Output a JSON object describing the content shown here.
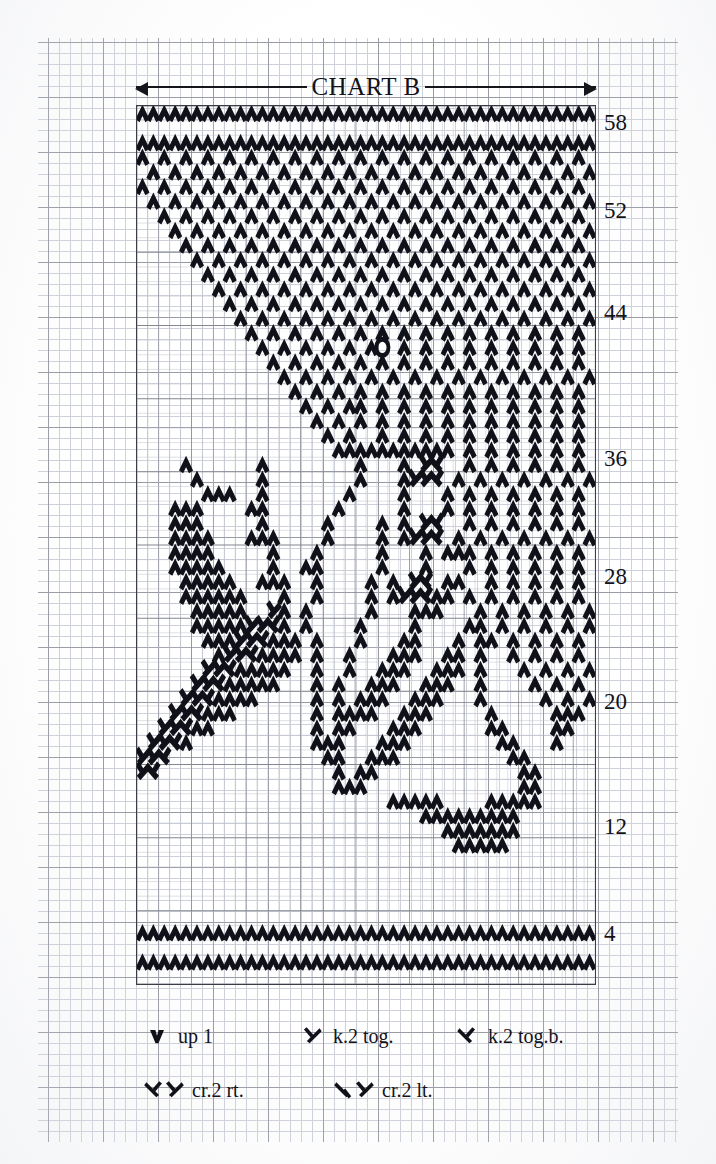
{
  "document": {
    "type": "knitting-stitch-chart",
    "title": "CHART B"
  },
  "chart": {
    "title": "CHART B",
    "columns": 42,
    "rows": 60,
    "row_numbers": [
      "58",
      "52",
      "44",
      "36",
      "28",
      "20",
      "12",
      "4"
    ],
    "row_number_values": [
      58,
      52,
      44,
      36,
      28,
      20,
      12,
      4
    ],
    "grid_color": "#c9ccd6",
    "major_grid_color": "#8d8f9a",
    "symbol_color": "#101119",
    "border_color": "#3b3d46"
  },
  "legend": {
    "rows": [
      [
        {
          "symbol": "up1",
          "label": "up 1"
        },
        {
          "symbol": "k2tog",
          "label": "k.2 tog."
        },
        {
          "symbol": "k2togb",
          "label": "k.2 tog.b."
        }
      ],
      [
        {
          "symbol": "cr2rt",
          "label": "cr.2 rt."
        },
        {
          "symbol": "cr2lt",
          "label": "cr.2 lt."
        }
      ]
    ]
  },
  "chart_data": {
    "type": "heatmap",
    "title": "CHART B",
    "xlabel": "",
    "ylabel": "",
    "legend_position": "bottom",
    "grid": true,
    "symbol_key": {
      "v": "up 1",
      "k": "k.2 tog.",
      "b": "k.2 tog.b.",
      "r": "cr.2 rt.",
      "l": "cr.2 lt.",
      "o": "special knot",
      ".": "empty"
    },
    "columns": 42,
    "rows": 60,
    "row_labels_right": [
      58,
      52,
      44,
      36,
      28,
      20,
      12,
      4
    ],
    "cells": [
      {
        "row": 60,
        "pattern": "vvvvvvvvvvvvvvvvvvvvvvvvvvvvvvvvvvvvvvvvvv"
      },
      {
        "row": 59,
        "pattern": ".........................................."
      },
      {
        "row": 58,
        "pattern": "vvvvvvvvvvvvvvvvvvvvvvvvvvvvvvvvvvvvvvvvvv"
      },
      {
        "row": 57,
        "pattern": "v.v.v.v.v.v.v.v.v.v.v.v.v.v.v.v.v.v.v.v.v."
      },
      {
        "row": 56,
        "pattern": ".v.v.v.v.v.v.v.v.v.v.v.v.v.v.v.v.v.v.v.v.v"
      },
      {
        "row": 55,
        "pattern": "v.v.v.v.v.v.v.v.v.v.v.v.v.v.v.v.v.v.v.v.v."
      },
      {
        "row": 54,
        "pattern": ".v.v.v.v.v.v.v.v.v.v.v.v.v.v.v.v.v.v.v.v.v"
      },
      {
        "row": 53,
        "pattern": "..v.v.v.v.v.v.v.v.v.v.v.v.v.v.v.v.v.v.v.v."
      },
      {
        "row": 52,
        "pattern": "...v.v.v.v.v.v.v.v.v.v.v.v.v.v.v.v.v.v.v.v"
      },
      {
        "row": 51,
        "pattern": "....v.v.v.v.v.v.v.v.v.v.v.v.v.v.v.v.v.v.v."
      },
      {
        "row": 50,
        "pattern": ".....v.v.v.v.v.v.v.v.v.v.v.v.v.v.v.v.v.v.v"
      },
      {
        "row": 49,
        "pattern": "......v.v.v.v.v.v.v.v.v.v.v.v.v.v.v.v.v.v."
      },
      {
        "row": 48,
        "pattern": ".......v.v.v.v.v.v.v.v.v.v.v.v.v.v.v.v.v.v"
      },
      {
        "row": 47,
        "pattern": "........v.v.v.v.v.v.v.v.v.v.v.v.v.v.v.v.v."
      },
      {
        "row": 46,
        "pattern": ".........v.v.v.v.v.v.v.v.v.v.v.v.v.v.v.v.v"
      },
      {
        "row": 45,
        "pattern": "..........v.v.v.v.v.v.v.v.v.v.v.v.v.v.v.v."
      },
      {
        "row": 44,
        "pattern": "...........v.v.v.v.v.vo.v.v.v.v.v.v.v.v.v."
      },
      {
        "row": 43,
        "pattern": "............v.v.v.v.v.v.v.v.v.v.v.v.v.v.v."
      },
      {
        "row": 42,
        "pattern": ".............v.v.v.v.v.v.v.v.v.v.v.v.v.v.v"
      },
      {
        "row": 41,
        "pattern": "..............v.v.v.v.v.v.v.v.v.v.v.v.v.v."
      },
      {
        "row": 40,
        "pattern": "...............v.v.vv.v.v.v.v.v.v.v.v.v.v."
      },
      {
        "row": 39,
        "pattern": "................v.v.v.v.v.v.v.v.v.v.v.v.v."
      },
      {
        "row": 38,
        "pattern": ".................v.v..v.v.v.v.v.v.v.v.v.v."
      },
      {
        "row": 37,
        "pattern": "..................vvvvvvvvvvv.v.v.v.v.v.v."
      },
      {
        "row": 36,
        "pattern": "....v......v........v...v.rl..v.v.v.v.v.v."
      },
      {
        "row": 35,
        "pattern": ".....v.....v........v...vrrl.v.v.v.v.v.v.v"
      },
      {
        "row": 34,
        "pattern": "......vvv..v.......v....v...v.v.v.v.v.v.v."
      },
      {
        "row": 33,
        "pattern": "...vvv....vv......v.....v...v.v.v.v.v.v.v."
      },
      {
        "row": 32,
        "pattern": "...vvv.....v.....v....v.v.rl..v.v.v.v.v.v."
      },
      {
        "row": 31,
        "pattern": "...vvvv...vvv....v....v.vrrl.v.v.v.v.v.v.v"
      },
      {
        "row": 30,
        "pattern": "...vvvv.....v...v.....v...v.vvv.v.v.v.v.v."
      },
      {
        "row": 29,
        "pattern": "...vvvvv....v..vv.....v...v...v.v.v.v.v.v."
      },
      {
        "row": 28,
        "pattern": "....vvvvv..vvv..v....v.v.rl.vv..v.v.v.v.v."
      },
      {
        "row": 27,
        "pattern": "....vvvvvv...v..v....v.vrrlvv.v.v.v.v.v.v."
      },
      {
        "row": 26,
        "pattern": ".....vvvvv..rv.v.....v...vvv...v.v.v.v.v.v"
      },
      {
        "row": 25,
        "pattern": ".....vvvvvrrlv.v....v....v....vv.v.v.v.v.v"
      },
      {
        "row": 24,
        "pattern": "......vvvrrlvvv.v...v...vv...v.vv.v.v.v.v."
      },
      {
        "row": 23,
        "pattern": ".......vrrlvvvv.v..v...vvv..vv.v..v.v.v.v."
      },
      {
        "row": 22,
        "pattern": "......rrlvvvvv..v..v..vvv..vvv.v...v.v.v.v"
      },
      {
        "row": 21,
        "pattern": ".....rrlvvvvv...v.v..vvv..vvv..v....v.v.v."
      },
      {
        "row": 20,
        "pattern": "....rrlvvvv.....v.v.vvv..vvv...v.....v.v.v"
      },
      {
        "row": 19,
        "pattern": "...rrlvvv.......v.vvvv..vvv.....v.....vvv."
      },
      {
        "row": 18,
        "pattern": "..rrlvv.........v.vv...vvv......vv....vv.."
      },
      {
        "row": 17,
        "pattern": ".rrlv...........vvv...vvv........vv...v..."
      },
      {
        "row": 16,
        "pattern": "rrl..............vv..vvv..........vv......"
      },
      {
        "row": 15,
        "pattern": "rl................v.vv.............vv....."
      },
      {
        "row": 14,
        "pattern": "..................vvv..............vv....."
      },
      {
        "row": 13,
        "pattern": ".......................vvvvv....vvvvv....."
      },
      {
        "row": 12,
        "pattern": "..........................vvvvvvvvv......."
      },
      {
        "row": 11,
        "pattern": "............................vvvvvvv......."
      },
      {
        "row": 10,
        "pattern": ".............................vvvvv........"
      },
      {
        "row": 9,
        "pattern": ".........................................."
      },
      {
        "row": 8,
        "pattern": ".........................................."
      },
      {
        "row": 7,
        "pattern": ".........................................."
      },
      {
        "row": 6,
        "pattern": ".........................................."
      },
      {
        "row": 5,
        "pattern": ".........................................."
      },
      {
        "row": 4,
        "pattern": "vvvvvvvvvvvvvvvvvvvvvvvvvvvvvvvvvvvvvvvvvv"
      },
      {
        "row": 3,
        "pattern": ".........................................."
      },
      {
        "row": 2,
        "pattern": "vvvvvvvvvvvvvvvvvvvvvvvvvvvvvvvvvvvvvvvvvv"
      },
      {
        "row": 1,
        "pattern": ".........................................."
      }
    ]
  }
}
